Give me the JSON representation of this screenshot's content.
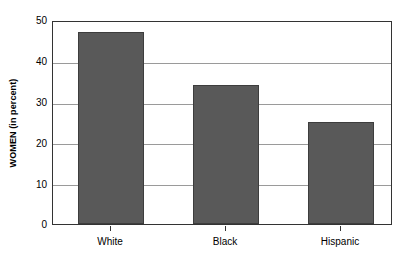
{
  "chart_data": {
    "type": "bar",
    "title": "",
    "xlabel": "",
    "ylabel": "WOMEN (in percent)",
    "categories": [
      "White",
      "Black",
      "Hispanic"
    ],
    "values": [
      47,
      34,
      25
    ],
    "series": [
      {
        "name": "WOMEN (in percent)",
        "values": [
          47,
          34,
          25
        ]
      }
    ],
    "ylim": [
      0,
      50
    ],
    "ytick_labels": [
      "0",
      "10",
      "20",
      "30",
      "40",
      "50"
    ],
    "ytick_values": [
      0,
      10,
      20,
      30,
      40,
      50
    ],
    "grid": "horizontal",
    "legend": "none",
    "bar_color": "#595959",
    "bar_edge_color": "#3d3d3d",
    "grid_color": "#9a9a9a",
    "frame_color": "#333333",
    "background": "#ffffff"
  }
}
